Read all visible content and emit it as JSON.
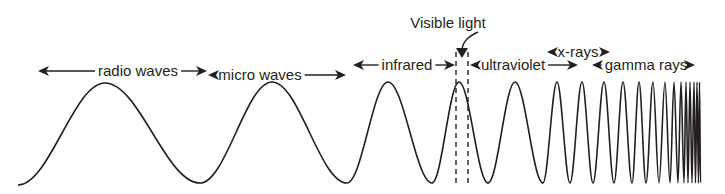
{
  "diagram": {
    "colors": {
      "ink": "#231f20",
      "background": "#ffffff"
    },
    "callout": {
      "text": "Visible light",
      "x": 448,
      "y": 28
    },
    "bands": [
      {
        "id": "radio",
        "label": "radio waves",
        "x_start": 38,
        "x_end": 207,
        "y": 71,
        "text_x": 138
      },
      {
        "id": "micro",
        "label": "micro waves",
        "x_start": 208,
        "x_end": 346,
        "y": 75,
        "text_x": 260
      },
      {
        "id": "infrared",
        "label": "infrared",
        "x_start": 353,
        "x_end": 455,
        "y": 65,
        "text_x": 407
      },
      {
        "id": "ultraviolet",
        "label": "ultraviolet",
        "x_start": 470,
        "x_end": 578,
        "y": 65,
        "text_x": 513
      },
      {
        "id": "xrays",
        "label": "x-rays",
        "x_start": 547,
        "x_end": 610,
        "y": 52,
        "text_x": 578
      },
      {
        "id": "gamma",
        "label": "gamma rays",
        "x_start": 592,
        "x_end": 695,
        "y": 65,
        "text_x": 646
      }
    ],
    "wave_extrema": [
      [
        18,
        185
      ],
      [
        105,
        83
      ],
      [
        200,
        183
      ],
      [
        272,
        82
      ],
      [
        347,
        183
      ],
      [
        388,
        82
      ],
      [
        432,
        183
      ],
      [
        459,
        82
      ],
      [
        488,
        183
      ],
      [
        515,
        82
      ],
      [
        543,
        183
      ],
      [
        557,
        82
      ],
      [
        570,
        183
      ],
      [
        582,
        82
      ],
      [
        593,
        183
      ],
      [
        604,
        82
      ],
      [
        614,
        183
      ],
      [
        623,
        82
      ],
      [
        632,
        183
      ],
      [
        639,
        82
      ],
      [
        646,
        183
      ],
      [
        653,
        82
      ],
      [
        659,
        183
      ],
      [
        665,
        82
      ],
      [
        670,
        183
      ],
      [
        674,
        82
      ],
      [
        678,
        183
      ],
      [
        681,
        82
      ],
      [
        684,
        183
      ],
      [
        686,
        82
      ],
      [
        688,
        183
      ],
      [
        690,
        82
      ],
      [
        692,
        183
      ],
      [
        694,
        82
      ],
      [
        695.5,
        183
      ],
      [
        697,
        82
      ],
      [
        698.5,
        183
      ],
      [
        699.5,
        82
      ],
      [
        700.5,
        183
      ]
    ],
    "visible_band": {
      "x1": 456,
      "x2": 468,
      "y_top": 52,
      "y_bottom": 186
    }
  }
}
